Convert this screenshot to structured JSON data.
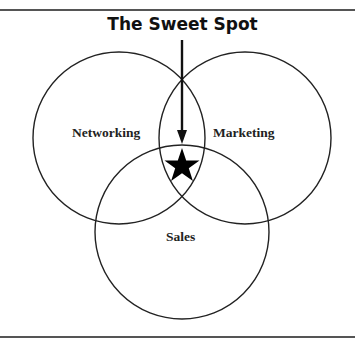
{
  "diagram": {
    "title": "The Sweet Spot",
    "circles": [
      {
        "label": "Networking"
      },
      {
        "label": "Marketing"
      },
      {
        "label": "Sales"
      }
    ],
    "center_marker": "star-icon",
    "colors": {
      "line": "#222222",
      "background": "#ffffff"
    }
  }
}
